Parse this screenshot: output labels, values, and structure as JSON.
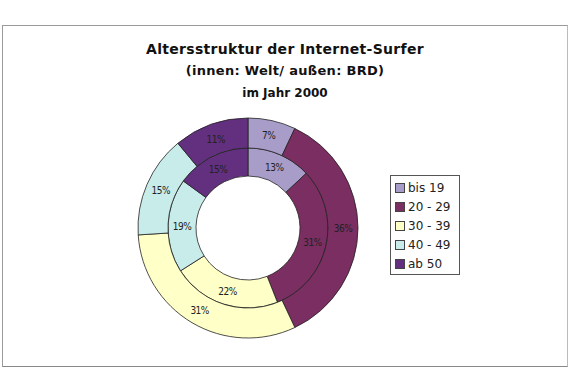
{
  "chart_data": {
    "type": "pie",
    "subtype": "donut-nested",
    "title": "Altersstruktur der Internet-Surfer",
    "subtitle": "(innen: Welt/ außen: BRD)",
    "subtitle2": "im Jahr 2000",
    "categories": [
      "bis 19",
      "20 - 29",
      "30 - 39",
      "40 - 49",
      "ab 50"
    ],
    "colors": [
      "#a89cc8",
      "#7a2e62",
      "#ffffc8",
      "#c8ecea",
      "#62307e"
    ],
    "series": [
      {
        "name": "Welt (innen)",
        "ring": "inner",
        "values": [
          13,
          31,
          22,
          19,
          15
        ],
        "labels": [
          "13%",
          "31%",
          "22%",
          "19%",
          "15%"
        ]
      },
      {
        "name": "BRD (außen)",
        "ring": "outer",
        "values": [
          7,
          36,
          31,
          15,
          11
        ],
        "labels": [
          "7%",
          "36%",
          "31%",
          "15%",
          "11%"
        ]
      }
    ],
    "legend_position": "right",
    "unit": "%"
  }
}
